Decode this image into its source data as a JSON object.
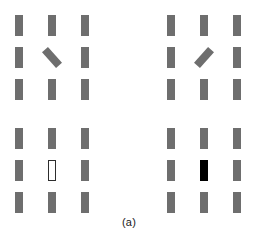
{
  "figure": {
    "caption": "(a)",
    "width": 258,
    "height": 239,
    "background_color": "#ffffff",
    "bar_color": "#6e6e6e",
    "outline_target_fill": "#ffffff",
    "outline_target_stroke": "#2d2d2d",
    "filled_target_color": "#000000"
  },
  "panels": [
    {
      "id": "top-left",
      "position": "top-left",
      "target_type": "orientation-tilt-right",
      "target_description": "bar tilted clockwise-from-vertical leaning like a forward slash",
      "target_cell": "row2-col2",
      "distractor_count": 8,
      "distractor_orientation": "vertical",
      "cells": [
        {
          "row": 0,
          "col": 0,
          "type": "distractor"
        },
        {
          "row": 0,
          "col": 1,
          "type": "distractor"
        },
        {
          "row": 0,
          "col": 2,
          "type": "distractor"
        },
        {
          "row": 1,
          "col": 0,
          "type": "distractor"
        },
        {
          "row": 1,
          "col": 1,
          "type": "target-tilt-right"
        },
        {
          "row": 1,
          "col": 2,
          "type": "distractor"
        },
        {
          "row": 2,
          "col": 0,
          "type": "distractor"
        },
        {
          "row": 2,
          "col": 1,
          "type": "distractor"
        },
        {
          "row": 2,
          "col": 2,
          "type": "distractor"
        }
      ]
    },
    {
      "id": "top-right",
      "position": "top-right",
      "target_type": "orientation-tilt-left",
      "target_description": "bar tilted counter-clockwise-from-vertical leaning like a backslash",
      "target_cell": "row2-col2",
      "distractor_count": 8,
      "distractor_orientation": "vertical",
      "cells": [
        {
          "row": 0,
          "col": 0,
          "type": "distractor"
        },
        {
          "row": 0,
          "col": 1,
          "type": "distractor"
        },
        {
          "row": 0,
          "col": 2,
          "type": "distractor"
        },
        {
          "row": 1,
          "col": 0,
          "type": "distractor"
        },
        {
          "row": 1,
          "col": 1,
          "type": "target-tilt-left"
        },
        {
          "row": 1,
          "col": 2,
          "type": "distractor"
        },
        {
          "row": 2,
          "col": 0,
          "type": "distractor"
        },
        {
          "row": 2,
          "col": 1,
          "type": "distractor"
        },
        {
          "row": 2,
          "col": 2,
          "type": "distractor"
        }
      ]
    },
    {
      "id": "bottom-left",
      "position": "bottom-left",
      "target_type": "luminance-white-outline",
      "target_description": "white unfilled bar with dark outline among gray bars",
      "target_cell": "row2-col2",
      "distractor_count": 8,
      "distractor_orientation": "vertical",
      "cells": [
        {
          "row": 0,
          "col": 0,
          "type": "distractor"
        },
        {
          "row": 0,
          "col": 1,
          "type": "distractor"
        },
        {
          "row": 0,
          "col": 2,
          "type": "distractor"
        },
        {
          "row": 1,
          "col": 0,
          "type": "distractor"
        },
        {
          "row": 1,
          "col": 1,
          "type": "target-outline"
        },
        {
          "row": 1,
          "col": 2,
          "type": "distractor"
        },
        {
          "row": 2,
          "col": 0,
          "type": "distractor"
        },
        {
          "row": 2,
          "col": 1,
          "type": "distractor"
        },
        {
          "row": 2,
          "col": 2,
          "type": "distractor"
        }
      ]
    },
    {
      "id": "bottom-right",
      "position": "bottom-right",
      "target_type": "luminance-black-filled",
      "target_description": "solid black bar among gray bars",
      "target_cell": "row2-col2",
      "distractor_count": 8,
      "distractor_orientation": "vertical",
      "cells": [
        {
          "row": 0,
          "col": 0,
          "type": "distractor"
        },
        {
          "row": 0,
          "col": 1,
          "type": "distractor"
        },
        {
          "row": 0,
          "col": 2,
          "type": "distractor"
        },
        {
          "row": 1,
          "col": 0,
          "type": "distractor"
        },
        {
          "row": 1,
          "col": 1,
          "type": "target-filled-black"
        },
        {
          "row": 1,
          "col": 2,
          "type": "distractor"
        },
        {
          "row": 2,
          "col": 0,
          "type": "distractor"
        },
        {
          "row": 2,
          "col": 1,
          "type": "distractor"
        },
        {
          "row": 2,
          "col": 2,
          "type": "distractor"
        }
      ]
    }
  ]
}
